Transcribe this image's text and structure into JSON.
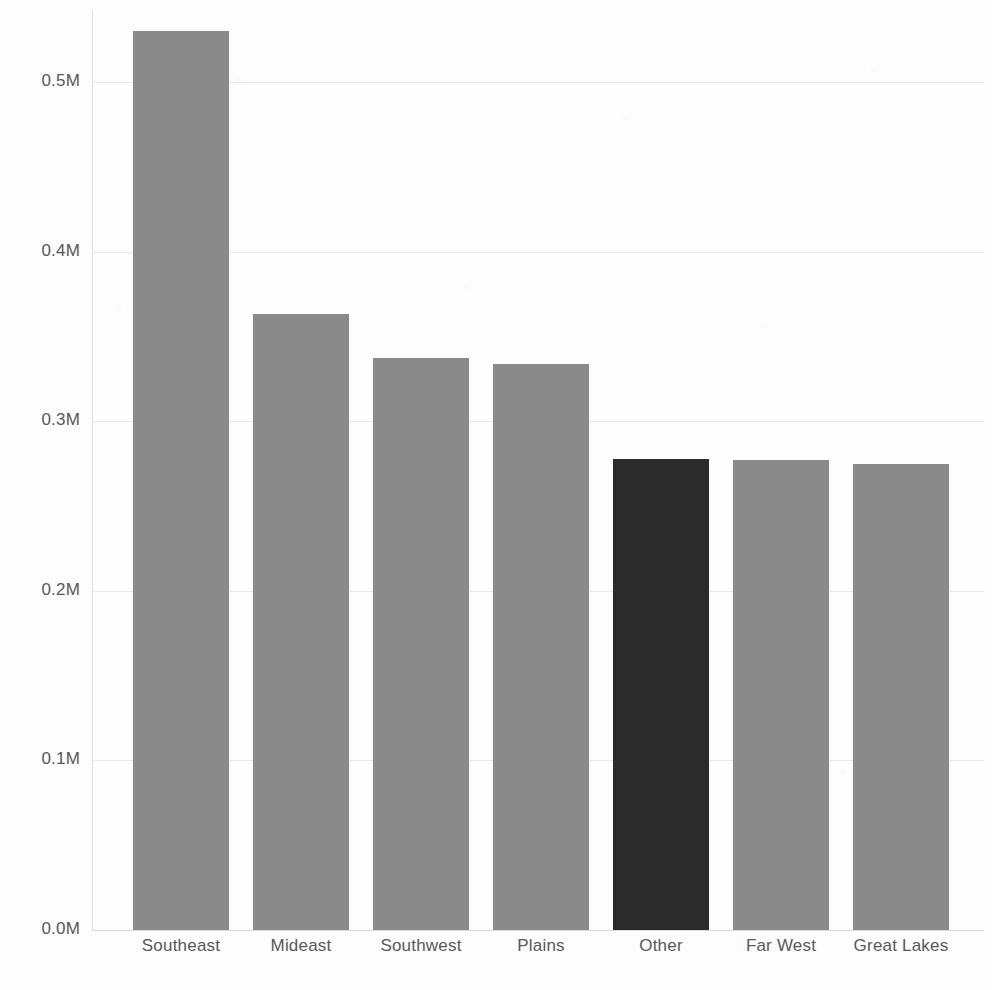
{
  "chart_data": {
    "type": "bar",
    "title": "",
    "subtitle": "",
    "xlabel": "",
    "ylabel": "",
    "categories": [
      "Southeast",
      "Mideast",
      "Southwest",
      "Plains",
      "Other",
      "Far West",
      "Great Lakes"
    ],
    "values": [
      0.53,
      0.363,
      0.337,
      0.334,
      0.278,
      0.277,
      0.275
    ],
    "value_unit": "M",
    "ylim": [
      0.0,
      0.5
    ],
    "y_ticks": [
      0.0,
      0.1,
      0.2,
      0.3,
      0.4,
      0.5
    ],
    "y_tick_labels": [
      "0.0M",
      "0.1M",
      "0.2M",
      "0.3M",
      "0.4M",
      "0.5M"
    ],
    "grid": true,
    "legend": false,
    "legend_position": "none",
    "orientation": "vertical",
    "bar_colors": [
      "#8a8a8a",
      "#8a8a8a",
      "#8a8a8a",
      "#8a8a8a",
      "#2b2b2b",
      "#8a8a8a",
      "#8a8a8a"
    ],
    "highlighted_category": "Other"
  },
  "colors": {
    "bar_default": "#8a8a8a",
    "bar_highlight": "#2b2b2b",
    "gridline": "#e9e9e9",
    "baseline": "#d9d9d9",
    "axis": "#dedede",
    "tick_text": "#585858",
    "background": "#fdfdfd"
  },
  "geometry": {
    "plot_left": 92,
    "plot_right": 984,
    "plot_top": 10,
    "baseline_y": 930,
    "px_per_unit": 1696,
    "bar_width": 96,
    "bar_pitch": 120,
    "first_bar_left": 133
  }
}
